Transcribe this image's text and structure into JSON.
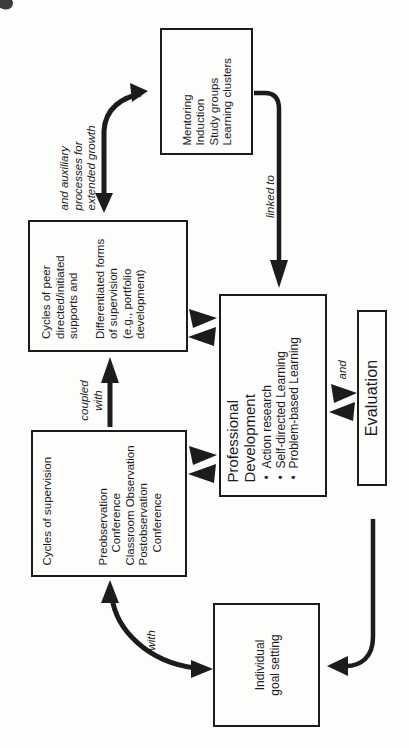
{
  "diagram": {
    "boxes": {
      "mentoring": {
        "lines": [
          "Mentoring",
          "Induction",
          "Study groups",
          "Learning clusters"
        ]
      },
      "peer_cycles": {
        "para1": [
          "Cycles of peer",
          "directed/initiated",
          "supports and"
        ],
        "para2": [
          "Differentiated forms",
          "of supervision",
          "(e.g., portfolio",
          "development)"
        ]
      },
      "supervision_cycles": {
        "title": "Cycles of supervision",
        "items": [
          "Preobservation",
          "Conference",
          "Classroom Observation",
          "Postobservation",
          "Conference"
        ]
      },
      "professional_development": {
        "title_lines": [
          "Professional",
          "Development"
        ],
        "bullets": [
          "Action research",
          "Self-directed Learning",
          "Problem-based Learning"
        ]
      },
      "evaluation": {
        "label": "Evaluation"
      },
      "individual_goal": {
        "lines": [
          "Individual",
          "goal setting"
        ]
      }
    },
    "labels": {
      "auxiliary": [
        "and auxiliary",
        "processes for",
        "extended growth"
      ],
      "linked_to": "linked to",
      "coupled_with": [
        "coupled",
        "with"
      ],
      "and": "and",
      "with": "with"
    },
    "glyphs": {
      "bullet": "•"
    },
    "colors": {
      "ink": "#1c1c1c",
      "background": "#fdfdfc"
    }
  }
}
